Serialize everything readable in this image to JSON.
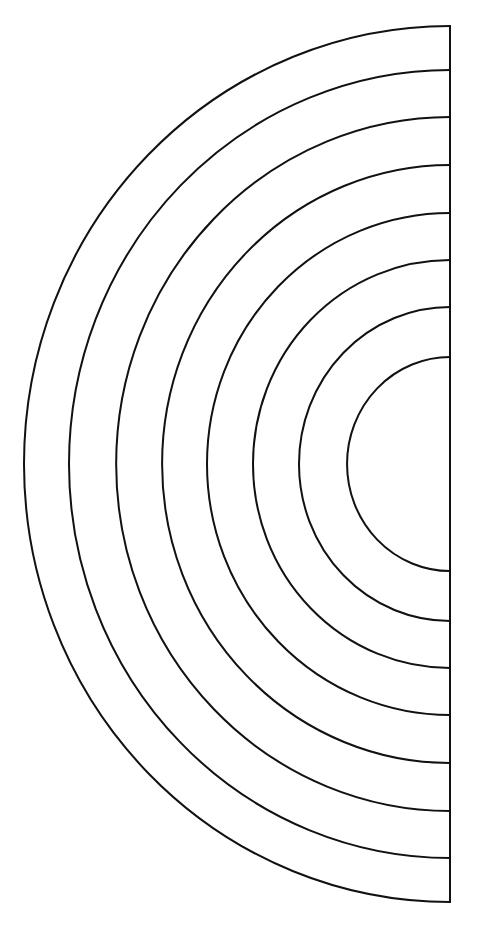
{
  "page": {
    "background_color": "#ffffff",
    "width": 479,
    "height": 941
  },
  "figure": {
    "name": "nested-semicircle-bands",
    "stroke_color": "#111111",
    "fill_color": "none",
    "stroke_width": 2,
    "center_x": 450,
    "center_y": 464,
    "orientation": "left-facing semicircles (180 degrees, from top of spine counter-clockwise to bottom of spine)",
    "band_count": 7,
    "arc_count": 8,
    "spine": {
      "name": "right-edge-spine",
      "x": 450,
      "y_top": 26,
      "y_bottom": 902
    },
    "arcs": [
      {
        "index": 1,
        "label": "outermost-arc",
        "rx": 426,
        "ry": 438,
        "leftmost_x": 24,
        "top_y": 26,
        "bottom_y": 902
      },
      {
        "index": 2,
        "label": "arc-2",
        "rx": 381,
        "ry": 394,
        "leftmost_x": 69,
        "top_y": 70,
        "bottom_y": 858
      },
      {
        "index": 3,
        "label": "arc-3",
        "rx": 334,
        "ry": 347,
        "leftmost_x": 116,
        "top_y": 117,
        "bottom_y": 811
      },
      {
        "index": 4,
        "label": "arc-4",
        "rx": 288,
        "ry": 299,
        "leftmost_x": 162,
        "top_y": 165,
        "bottom_y": 763
      },
      {
        "index": 5,
        "label": "arc-5",
        "rx": 243,
        "ry": 251,
        "leftmost_x": 207,
        "top_y": 213,
        "bottom_y": 715
      },
      {
        "index": 6,
        "label": "arc-6",
        "rx": 197,
        "ry": 204,
        "leftmost_x": 253,
        "top_y": 260,
        "bottom_y": 668
      },
      {
        "index": 7,
        "label": "arc-7",
        "rx": 151,
        "ry": 157,
        "leftmost_x": 299,
        "top_y": 307,
        "bottom_y": 621
      },
      {
        "index": 8,
        "label": "innermost-arc",
        "rx": 103,
        "ry": 107,
        "leftmost_x": 347,
        "top_y": 357,
        "bottom_y": 571
      }
    ]
  },
  "chart_data": {
    "type": "line",
    "xlabel": "",
    "ylabel": "",
    "categories": [
      "outermost-arc",
      "arc-2",
      "arc-3",
      "arc-4",
      "arc-5",
      "arc-6",
      "arc-7",
      "innermost-arc"
    ],
    "series": [
      {
        "name": "horizontal-radius-px",
        "values": [
          426,
          381,
          334,
          288,
          243,
          197,
          151,
          103
        ]
      },
      {
        "name": "vertical-radius-px",
        "values": [
          438,
          394,
          347,
          299,
          251,
          204,
          157,
          107
        ]
      },
      {
        "name": "band-gap-px",
        "values": [
          45,
          47,
          46,
          45,
          46,
          46,
          48,
          0
        ]
      }
    ],
    "annotations": [
      "All arcs share center (450, 464)",
      "Arcs terminate on a vertical spine at x = 450",
      "Band widths are approximately uniform at 45-48 px"
    ],
    "grid": false,
    "legend_position": "none"
  }
}
